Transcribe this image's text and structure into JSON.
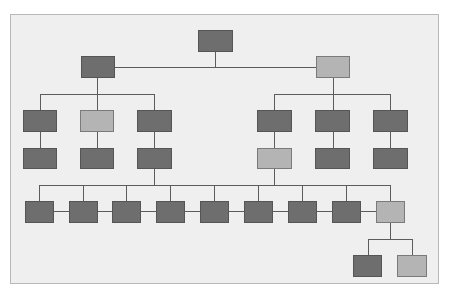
{
  "diagram": {
    "type": "org-chart",
    "colors": {
      "dark_node": "#6e6e6e",
      "light_node": "#b4b4b4",
      "connector": "#5c5c5c",
      "background": "#efefef"
    },
    "nodes": [
      {
        "id": "root",
        "shade": "dark"
      },
      {
        "id": "l1-left",
        "shade": "dark",
        "parent": "root"
      },
      {
        "id": "l1-right",
        "shade": "light",
        "parent": "root"
      },
      {
        "id": "l2-a",
        "shade": "dark",
        "parent": "l1-left"
      },
      {
        "id": "l2-b",
        "shade": "light",
        "parent": "l1-left"
      },
      {
        "id": "l2-c",
        "shade": "dark",
        "parent": "l1-left"
      },
      {
        "id": "l2-d",
        "shade": "dark",
        "parent": "l1-right"
      },
      {
        "id": "l2-e",
        "shade": "dark",
        "parent": "l1-right"
      },
      {
        "id": "l2-f",
        "shade": "dark",
        "parent": "l1-right"
      },
      {
        "id": "l3-a",
        "shade": "dark",
        "parent": "l2-a"
      },
      {
        "id": "l3-b",
        "shade": "dark",
        "parent": "l2-b"
      },
      {
        "id": "l3-c",
        "shade": "dark",
        "parent": "l2-c"
      },
      {
        "id": "l3-d",
        "shade": "light",
        "parent": "l2-d"
      },
      {
        "id": "l3-e",
        "shade": "dark",
        "parent": "l2-e"
      },
      {
        "id": "l3-f",
        "shade": "dark",
        "parent": "l2-f"
      },
      {
        "id": "l4-1",
        "shade": "dark"
      },
      {
        "id": "l4-2",
        "shade": "dark"
      },
      {
        "id": "l4-3",
        "shade": "dark"
      },
      {
        "id": "l4-4",
        "shade": "dark"
      },
      {
        "id": "l4-5",
        "shade": "dark"
      },
      {
        "id": "l4-6",
        "shade": "dark"
      },
      {
        "id": "l4-7",
        "shade": "dark"
      },
      {
        "id": "l4-8",
        "shade": "dark"
      },
      {
        "id": "l4-9",
        "shade": "light"
      },
      {
        "id": "l5-1",
        "shade": "dark",
        "parent": "l4-9"
      },
      {
        "id": "l5-2",
        "shade": "light",
        "parent": "l4-9"
      }
    ]
  }
}
